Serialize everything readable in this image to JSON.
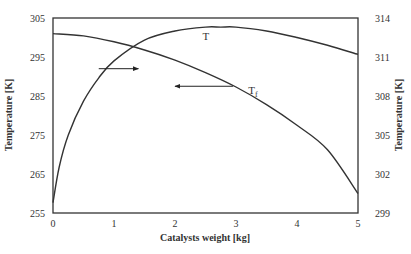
{
  "chart_data": {
    "type": "line",
    "title": "",
    "xlabel": "Catalysts weight [kg]",
    "ylabel": "Temperature [K]",
    "ylabel_right": "Temperature [K]",
    "xlim": [
      0,
      5
    ],
    "ylim": [
      255,
      305
    ],
    "ylim_right": [
      299,
      314
    ],
    "x_ticks": [
      "0",
      "1",
      "2",
      "3",
      "4",
      "5"
    ],
    "y_ticks_left": [
      "255",
      "265",
      "275",
      "285",
      "295",
      "305"
    ],
    "y_ticks_right": [
      "299",
      "302",
      "305",
      "308",
      "311",
      "314"
    ],
    "grid": false,
    "legend": "none",
    "series": [
      {
        "name": "T",
        "axis": "right",
        "x": [
          0,
          0.1,
          0.25,
          0.5,
          0.75,
          1.0,
          1.5,
          2.0,
          2.5,
          2.75,
          3.0,
          3.5,
          4.0,
          4.5,
          5.0
        ],
        "values": [
          299.8,
          302.5,
          305.0,
          307.6,
          309.4,
          310.7,
          312.3,
          313.0,
          313.3,
          313.3,
          313.3,
          313.0,
          312.5,
          311.9,
          311.2
        ]
      },
      {
        "name": "Tf",
        "axis": "left",
        "x": [
          0,
          0.5,
          1.0,
          1.5,
          2.0,
          2.5,
          3.0,
          3.5,
          4.0,
          4.5,
          5.0
        ],
        "values": [
          301.0,
          300.4,
          298.9,
          296.8,
          294.2,
          291.0,
          287.3,
          282.8,
          277.5,
          271.2,
          260.0
        ]
      }
    ],
    "annotations": [
      {
        "text": "T",
        "x": 2.45,
        "y_right": 313.0
      },
      {
        "text": "Tf",
        "x": 3.2,
        "y_left": 285.5
      },
      {
        "text": "arrow-right",
        "description": "points from T curve to right axis",
        "from_x": 0.75,
        "to_x": 1.4,
        "y_left": 292.0
      },
      {
        "text": "arrow-left",
        "description": "points from Tf curve to left axis",
        "from_x": 2.95,
        "to_x": 2.0,
        "y_left": 287.5
      }
    ]
  }
}
